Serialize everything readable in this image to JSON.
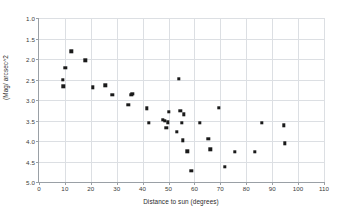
{
  "chart_data": {
    "type": "scatter",
    "title": "",
    "xlabel": "Distance to sun (degrees)",
    "ylabel": "(Mag/ arcsec^2",
    "xlim": [
      0,
      110
    ],
    "ylim": [
      5.0,
      1.0
    ],
    "y_inverted": true,
    "grid": true,
    "legend": null,
    "xticks": [
      0,
      10,
      20,
      30,
      40,
      50,
      60,
      70,
      80,
      90,
      100,
      110
    ],
    "xtick_labels": [
      "0",
      "10",
      "20",
      "30",
      "40",
      "50",
      "60",
      "70",
      "80",
      "90",
      "100",
      "110"
    ],
    "yticks": [
      1.0,
      1.5,
      2.0,
      2.5,
      3.0,
      3.5,
      4.0,
      4.5,
      5.0
    ],
    "ytick_labels": [
      "1.0",
      "1.5",
      "2.0",
      "2.5",
      "3.0",
      "3.5",
      "4.0",
      "4.5",
      "5.0"
    ],
    "marker": "square",
    "marker_color": "#1a1a1a",
    "points": [
      {
        "x": 9.3,
        "y": 2.51
      },
      {
        "x": 9.4,
        "y": 2.67
      },
      {
        "x": 10.1,
        "y": 2.21
      },
      {
        "x": 12.5,
        "y": 1.81
      },
      {
        "x": 17.8,
        "y": 2.03
      },
      {
        "x": 20.7,
        "y": 2.69
      },
      {
        "x": 25.6,
        "y": 2.64
      },
      {
        "x": 28.3,
        "y": 2.88
      },
      {
        "x": 34.5,
        "y": 3.12
      },
      {
        "x": 35.6,
        "y": 2.87
      },
      {
        "x": 36.0,
        "y": 2.85
      },
      {
        "x": 41.7,
        "y": 3.2
      },
      {
        "x": 42.3,
        "y": 3.55
      },
      {
        "x": 47.8,
        "y": 3.49
      },
      {
        "x": 48.6,
        "y": 3.5
      },
      {
        "x": 49.2,
        "y": 3.68
      },
      {
        "x": 49.8,
        "y": 3.54
      },
      {
        "x": 50.2,
        "y": 3.29
      },
      {
        "x": 53.1,
        "y": 3.78
      },
      {
        "x": 54.0,
        "y": 2.49
      },
      {
        "x": 54.5,
        "y": 3.27
      },
      {
        "x": 55.2,
        "y": 3.55
      },
      {
        "x": 55.6,
        "y": 3.98
      },
      {
        "x": 56.0,
        "y": 3.35
      },
      {
        "x": 57.3,
        "y": 4.25
      },
      {
        "x": 58.8,
        "y": 4.72
      },
      {
        "x": 62.0,
        "y": 3.56
      },
      {
        "x": 65.4,
        "y": 3.95
      },
      {
        "x": 66.1,
        "y": 4.2
      },
      {
        "x": 69.3,
        "y": 3.19
      },
      {
        "x": 71.6,
        "y": 4.63
      },
      {
        "x": 75.6,
        "y": 4.26
      },
      {
        "x": 83.4,
        "y": 4.26
      },
      {
        "x": 86.0,
        "y": 3.55
      },
      {
        "x": 94.6,
        "y": 3.62
      },
      {
        "x": 94.9,
        "y": 4.06
      }
    ]
  }
}
